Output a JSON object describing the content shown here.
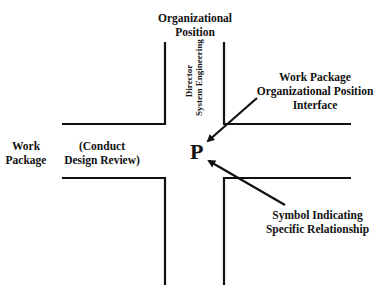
{
  "diagram": {
    "top_label_line1": "Organizational",
    "top_label_line2": "Position",
    "left_label_line1": "Work",
    "left_label_line2": "Package",
    "center_left_line1": "(Conduct",
    "center_left_line2": "Design Review)",
    "vertical_line1": "Director",
    "vertical_line2": "System Engineering",
    "symbol": "P",
    "right_top_line1": "Work Package",
    "right_top_line2": "Organizational Position",
    "right_top_line3": "Interface",
    "right_bottom_line1": "Symbol Indicating",
    "right_bottom_line2": "Specific Relationship",
    "line_color": "#111111"
  }
}
